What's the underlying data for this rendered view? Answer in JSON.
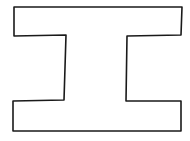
{
  "figure": {
    "stroke_color": "#1a1a1a",
    "fill_color": "#ffffff",
    "background": "#ffffff",
    "stroke_width": 1.6,
    "outline_points": "14,7 182,7 181,35 127,36 126,101 181,101 181,131 13,131 13,101 64,100 66,35 14,36"
  }
}
